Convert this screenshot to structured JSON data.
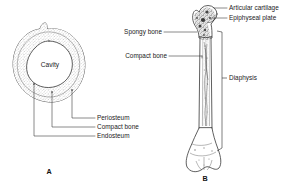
{
  "figure": {
    "background_color": "#ffffff",
    "ink_color": "#2b2b2b",
    "text_color": "#1a1a1a"
  },
  "panel_a": {
    "letter": "A",
    "caption": "Cross section of bone shaft",
    "center_label": "Cavity",
    "labels": [
      {
        "id": "periosteum",
        "text": "Periosteum"
      },
      {
        "id": "compact-bone",
        "text": "Compact bone"
      },
      {
        "id": "endosteum",
        "text": "Endosteum"
      }
    ]
  },
  "panel_b": {
    "letter": "B",
    "caption": "Longitudinal section of long bone",
    "labels_left": [
      {
        "id": "spongy-bone",
        "text": "Spongy bone"
      },
      {
        "id": "compact-bone",
        "text": "Compact bone"
      }
    ],
    "labels_right": [
      {
        "id": "articular-cartilage",
        "text": "Articular cartilage"
      },
      {
        "id": "epiphyseal-plate",
        "text": "Epiphyseal plate"
      },
      {
        "id": "diaphysis",
        "text": "Diaphysis"
      }
    ]
  }
}
